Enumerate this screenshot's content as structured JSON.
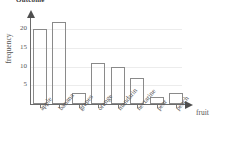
{
  "chart_data": {
    "type": "bar",
    "title": "Outcome",
    "xlabel": "fruit",
    "ylabel": "frequency",
    "categories": [
      "apple",
      "banana",
      "grapes",
      "orange",
      "mandarin",
      "nectarine",
      "pear",
      "peach"
    ],
    "values": [
      20,
      22,
      3,
      11,
      10,
      7,
      2,
      3
    ],
    "ytick_labels": [
      "5",
      "10",
      "15",
      "20"
    ],
    "ytick_values": [
      5,
      10,
      15,
      20
    ],
    "ylim": [
      0,
      24
    ],
    "grid": true,
    "legend": "none",
    "bar_style": "outlined-unfilled",
    "bar_outline_color": "#8a8a8a",
    "axis_color": "#6b6b6b",
    "grid_color": "#ececec",
    "text_color": "#555555",
    "background": "#ffffff",
    "x_axis_has_arrow": true,
    "y_axis_has_arrow": true,
    "category_label_rotation": -50
  }
}
